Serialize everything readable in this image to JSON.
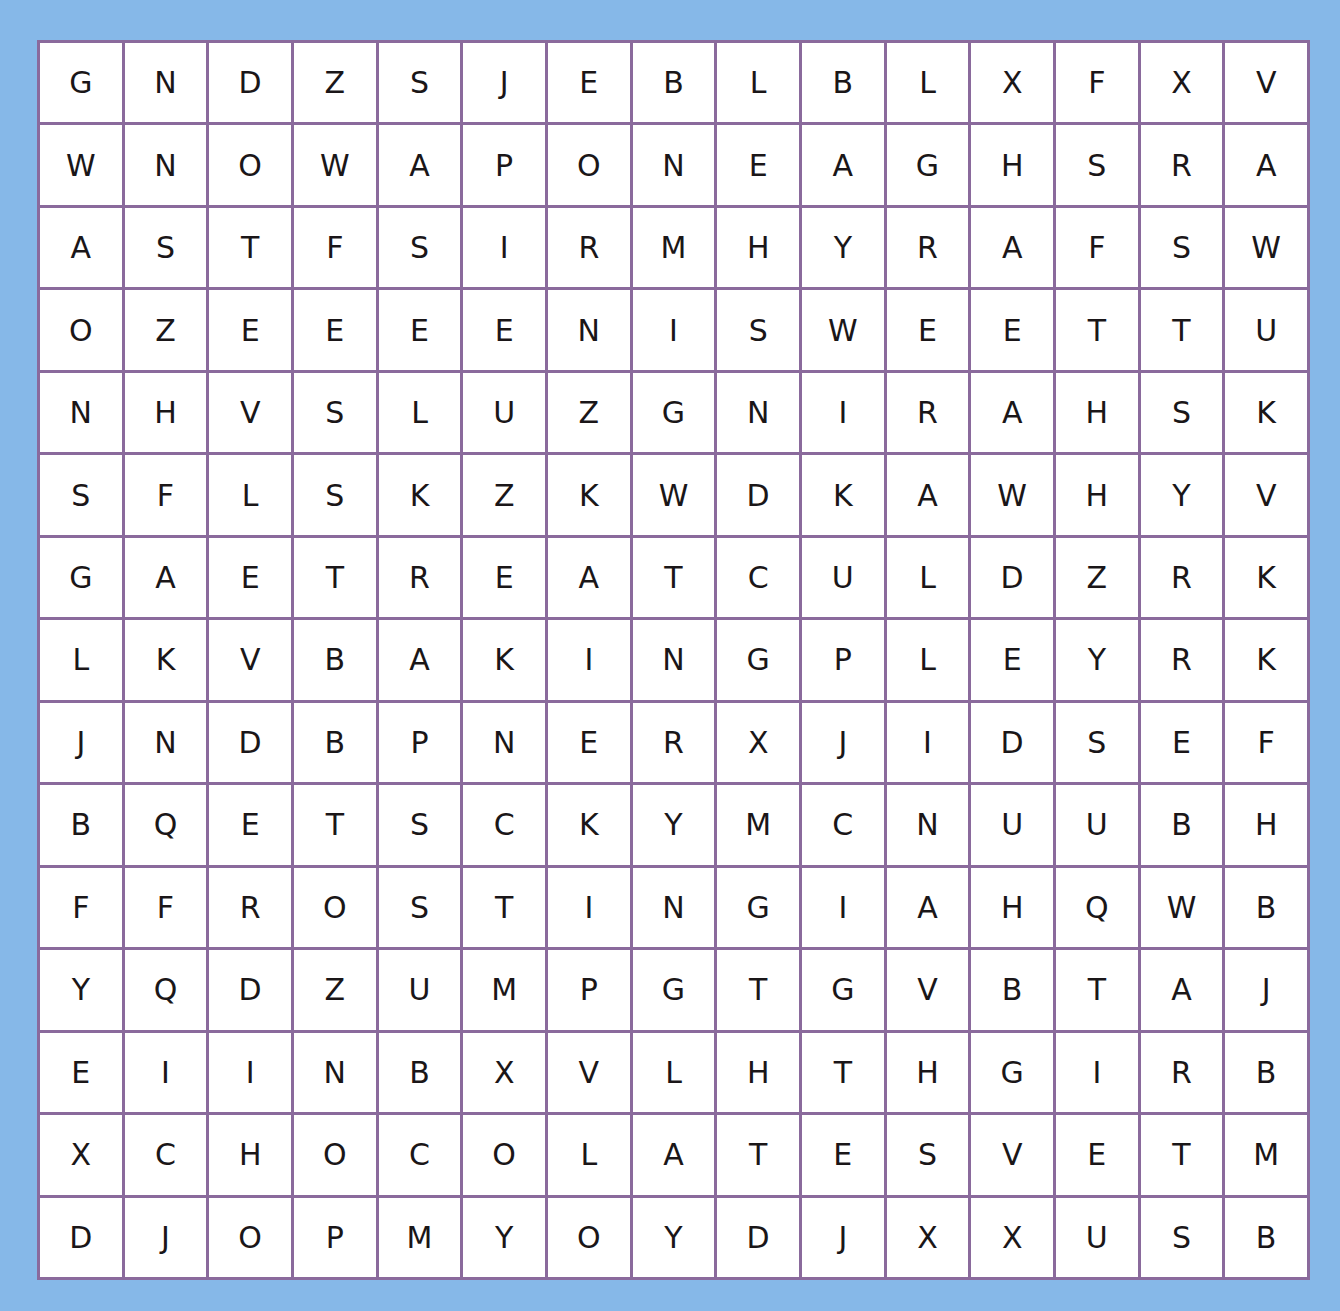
{
  "puzzle": {
    "rows": 15,
    "cols": 15,
    "colors": {
      "background": "#86b8e8",
      "grid_line": "#8a6a9c",
      "cell": "#ffffff",
      "letter": "#1a1618"
    },
    "grid": [
      [
        "G",
        "N",
        "D",
        "Z",
        "S",
        "J",
        "E",
        "B",
        "L",
        "B",
        "L",
        "X",
        "F",
        "X",
        "V"
      ],
      [
        "W",
        "N",
        "O",
        "W",
        "A",
        "P",
        "O",
        "N",
        "E",
        "A",
        "G",
        "H",
        "S",
        "R",
        "A"
      ],
      [
        "A",
        "S",
        "T",
        "F",
        "S",
        "I",
        "R",
        "M",
        "H",
        "Y",
        "R",
        "A",
        "F",
        "S",
        "W"
      ],
      [
        "O",
        "Z",
        "E",
        "E",
        "E",
        "E",
        "N",
        "I",
        "S",
        "W",
        "E",
        "E",
        "T",
        "T",
        "U"
      ],
      [
        "N",
        "H",
        "V",
        "S",
        "L",
        "U",
        "Z",
        "G",
        "N",
        "I",
        "R",
        "A",
        "H",
        "S",
        "K"
      ],
      [
        "S",
        "F",
        "L",
        "S",
        "K",
        "Z",
        "K",
        "W",
        "D",
        "K",
        "A",
        "W",
        "H",
        "Y",
        "V"
      ],
      [
        "G",
        "A",
        "E",
        "T",
        "R",
        "E",
        "A",
        "T",
        "C",
        "U",
        "L",
        "D",
        "Z",
        "R",
        "K"
      ],
      [
        "L",
        "K",
        "V",
        "B",
        "A",
        "K",
        "I",
        "N",
        "G",
        "P",
        "L",
        "E",
        "Y",
        "R",
        "K"
      ],
      [
        "J",
        "N",
        "D",
        "B",
        "P",
        "N",
        "E",
        "R",
        "X",
        "J",
        "I",
        "D",
        "S",
        "E",
        "F"
      ],
      [
        "B",
        "Q",
        "E",
        "T",
        "S",
        "C",
        "K",
        "Y",
        "M",
        "C",
        "N",
        "U",
        "U",
        "B",
        "H"
      ],
      [
        "F",
        "F",
        "R",
        "O",
        "S",
        "T",
        "I",
        "N",
        "G",
        "I",
        "A",
        "H",
        "Q",
        "W",
        "B"
      ],
      [
        "Y",
        "Q",
        "D",
        "Z",
        "U",
        "M",
        "P",
        "G",
        "T",
        "G",
        "V",
        "B",
        "T",
        "A",
        "J"
      ],
      [
        "E",
        "I",
        "I",
        "N",
        "B",
        "X",
        "V",
        "L",
        "H",
        "T",
        "H",
        "G",
        "I",
        "R",
        "B"
      ],
      [
        "X",
        "C",
        "H",
        "O",
        "C",
        "O",
        "L",
        "A",
        "T",
        "E",
        "S",
        "V",
        "E",
        "T",
        "M"
      ],
      [
        "D",
        "J",
        "O",
        "P",
        "M",
        "Y",
        "O",
        "Y",
        "D",
        "J",
        "X",
        "X",
        "U",
        "S",
        "B"
      ]
    ]
  }
}
